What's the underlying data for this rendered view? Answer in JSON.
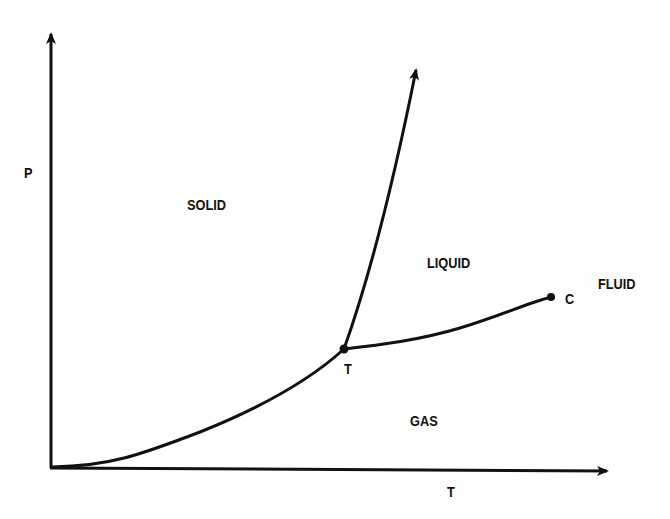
{
  "diagram": {
    "axes": {
      "x_label": "T",
      "y_label": "P"
    },
    "regions": {
      "solid": "SOLID",
      "liquid": "LIQUID",
      "gas": "GAS",
      "fluid": "FLUID"
    },
    "points": {
      "triple_point": "T",
      "critical_point": "C"
    },
    "curves": [
      {
        "name": "sublimation curve",
        "from": "origin",
        "to": "triple point"
      },
      {
        "name": "melting curve",
        "from": "triple point",
        "to": "top (arrow)"
      },
      {
        "name": "vaporization curve",
        "from": "triple point",
        "to": "critical point"
      }
    ],
    "colors": {
      "ink": "#111111",
      "background": "#ffffff"
    }
  }
}
